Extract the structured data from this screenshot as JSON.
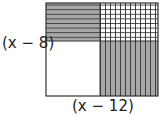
{
  "diagram": {
    "type": "area-model",
    "left_label": "(x − 8)",
    "bottom_label": "(x − 12)",
    "regions": [
      {
        "name": "top-left",
        "fill": "horizontal-lines",
        "color": "#a9a9a9"
      },
      {
        "name": "top-right",
        "fill": "grid",
        "color": "#ffffff"
      },
      {
        "name": "bottom-left",
        "fill": "none",
        "color": "#ffffff"
      },
      {
        "name": "bottom-right",
        "fill": "vertical-lines",
        "color": "#a9a9a9"
      }
    ]
  }
}
